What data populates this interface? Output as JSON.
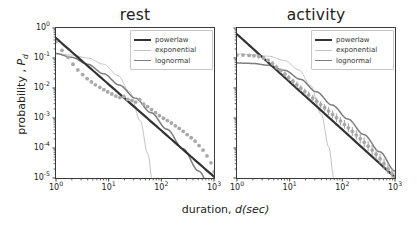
{
  "figure": {
    "xlabel_prefix": "duration, ",
    "xlabel_italic": "d(sec)",
    "ylabel_prefix": "probability , ",
    "ylabel_italic": "P",
    "ylabel_sub": "d"
  },
  "colors": {
    "powerlaw": "#333333",
    "exponential": "#b9b9b9",
    "lognormal": "#7d7d7d",
    "scatter": "#a8a8a8",
    "axis": "#3a3a3a",
    "text": "#222222"
  },
  "axis": {
    "xticks": [
      {
        "mantissa": "10",
        "exp": "0"
      },
      {
        "mantissa": "10",
        "exp": "1"
      },
      {
        "mantissa": "10",
        "exp": "2"
      },
      {
        "mantissa": "10",
        "exp": "3"
      }
    ],
    "yticks": [
      {
        "mantissa": "10",
        "exp": "0"
      },
      {
        "mantissa": "10",
        "exp": "-1"
      },
      {
        "mantissa": "10",
        "exp": "-2"
      },
      {
        "mantissa": "10",
        "exp": "-3"
      },
      {
        "mantissa": "10",
        "exp": "-4"
      },
      {
        "mantissa": "10",
        "exp": "-5"
      }
    ]
  },
  "legend": {
    "entries": [
      {
        "label": "powerlaw",
        "color": "#333333",
        "width": 2.3
      },
      {
        "label": "exponential",
        "color": "#c2c2c2",
        "width": 1.0
      },
      {
        "label": "lognormal",
        "color": "#7d7d7d",
        "width": 1.5
      }
    ]
  },
  "chart_data": {
    "type": "scatter",
    "xlabel": "duration, d(sec)",
    "ylabel": "probability , P_d",
    "xscale": "log",
    "yscale": "log",
    "xlim": [
      1,
      1000
    ],
    "ylim": [
      1e-05,
      1
    ],
    "grid": false,
    "legend_position": "upper right",
    "panels": [
      {
        "title": "rest",
        "series": [
          {
            "name": "data",
            "type": "scatter",
            "color": "#a8a8a8",
            "x": [
              1.0,
              1.3,
              1.7,
              2.1,
              2.6,
              3.2,
              3.9,
              4.7,
              5.6,
              6.8,
              8.1,
              9.6,
              11.5,
              13.7,
              16.3,
              19.4,
              23.0,
              27.4,
              32.6,
              38.8,
              46.1,
              54.8,
              65.2,
              77.5,
              92.1,
              109.6,
              130.3,
              154.9,
              184.2,
              219.0,
              260.4,
              309.6,
              368.1,
              437.7,
              520.4,
              618.8,
              735.6,
              874.8,
              1000.0
            ],
            "y": [
              0.35,
              0.18,
              0.105,
              0.062,
              0.04,
              0.028,
              0.0205,
              0.016,
              0.0128,
              0.0105,
              0.0088,
              0.0074,
              0.0063,
              0.0054,
              0.0048,
              0.0052,
              0.0042,
              0.0038,
              0.0034,
              0.0041,
              0.0029,
              0.0024,
              0.0019,
              0.0015,
              0.0012,
              0.00098,
              0.00082,
              0.00068,
              0.00055,
              0.00045,
              0.00036,
              0.00028,
              0.00022,
              0.00017,
              0.00012,
              8.5e-05,
              5.5e-05,
              3.2e-05,
              1.6e-05
            ]
          },
          {
            "name": "powerlaw",
            "type": "line",
            "color": "#333333",
            "x": [
              1.0,
              1000.0
            ],
            "y": [
              0.46,
              1.1e-05
            ],
            "alpha": 1.55
          },
          {
            "name": "exponential",
            "type": "line",
            "color": "#c2c2c2",
            "x": [
              1.0,
              2.0,
              4.0,
              8.0,
              15.0,
              25.0,
              40.0,
              55.0,
              70.0,
              85.0
            ],
            "y": [
              0.14,
              0.125,
              0.1,
              0.062,
              0.026,
              0.0075,
              0.0008,
              6.5e-05,
              5.5e-06,
              1e-05
            ]
          },
          {
            "name": "lognormal",
            "type": "line",
            "color": "#7d7d7d",
            "x": [
              1.0,
              2.0,
              4.0,
              8.0,
              16.0,
              32.0,
              64.0,
              128.0,
              256.0,
              512.0,
              1000.0
            ],
            "y": [
              0.14,
              0.105,
              0.062,
              0.03,
              0.0125,
              0.0046,
              0.0015,
              0.00042,
              9.5e-05,
              1.7e-05,
              2.4e-06
            ]
          }
        ]
      },
      {
        "title": "activity",
        "series": [
          {
            "name": "data",
            "type": "scatter",
            "color": "#a8a8a8",
            "x": [
              1.0,
              1.3,
              1.7,
              2.1,
              2.6,
              3.2,
              3.9,
              4.7,
              5.6,
              6.8,
              8.1,
              9.6,
              11.5,
              13.7,
              16.3,
              19.4,
              23.0,
              27.4,
              32.6,
              38.8,
              46.1,
              54.8,
              65.2,
              77.5,
              92.1,
              109.6,
              130.3,
              154.9,
              184.2,
              219.0,
              260.4,
              309.6,
              368.1,
              437.7,
              520.4,
              618.8,
              735.6,
              874.8,
              1000.0
            ],
            "y": [
              0.125,
              0.125,
              0.122,
              0.118,
              0.112,
              0.1,
              0.084,
              0.066,
              0.05,
              0.038,
              0.029,
              0.022,
              0.0168,
              0.0128,
              0.0098,
              0.0076,
              0.0059,
              0.0046,
              0.0036,
              0.0028,
              0.0022,
              0.0017,
              0.00132,
              0.00102,
              0.00079,
              0.00061,
              0.00047,
              0.00036,
              0.00027,
              0.000205,
              0.000155,
              0.000115,
              8.5e-05,
              6.2e-05,
              4.4e-05,
              3e-05,
              2e-05,
              1.4e-05,
              1.05e-05
            ],
            "errorbars": true
          },
          {
            "name": "powerlaw",
            "type": "line",
            "color": "#333333",
            "x": [
              1.0,
              1000.0
            ],
            "y": [
              0.62,
              1.05e-05
            ],
            "alpha": 1.6
          },
          {
            "name": "exponential",
            "type": "line",
            "color": "#c2c2c2",
            "x": [
              1.0,
              2.0,
              4.0,
              8.0,
              15.0,
              25.0,
              40.0,
              55.0,
              70.0
            ],
            "y": [
              0.135,
              0.13,
              0.115,
              0.082,
              0.04,
              0.012,
              0.0013,
              0.00011,
              9e-06
            ]
          },
          {
            "name": "lognormal",
            "type": "line",
            "color": "#7d7d7d",
            "x": [
              1.0,
              2.0,
              4.0,
              8.0,
              16.0,
              32.0,
              64.0,
              128.0,
              256.0,
              512.0,
              1000.0
            ],
            "y": [
              0.068,
              0.066,
              0.057,
              0.039,
              0.0195,
              0.0075,
              0.0027,
              0.00092,
              0.00028,
              7.5e-05,
              1.7e-05
            ]
          }
        ]
      }
    ]
  }
}
